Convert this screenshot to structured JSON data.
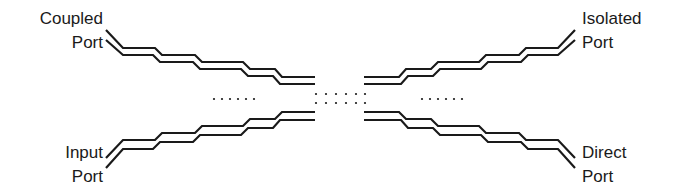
{
  "diagram": {
    "type": "multi-section directional coupler (coupled transmission lines)",
    "ports": {
      "coupled": {
        "line1": "Coupled",
        "line2": "Port"
      },
      "isolated": {
        "line1": "Isolated",
        "line2": "Port"
      },
      "input": {
        "line1": "Input",
        "line2": "Port"
      },
      "direct": {
        "line1": "Direct",
        "line2": "Port"
      }
    },
    "ellipsis": "......",
    "line_color": "#1a1a1a",
    "background": "#ffffff"
  }
}
